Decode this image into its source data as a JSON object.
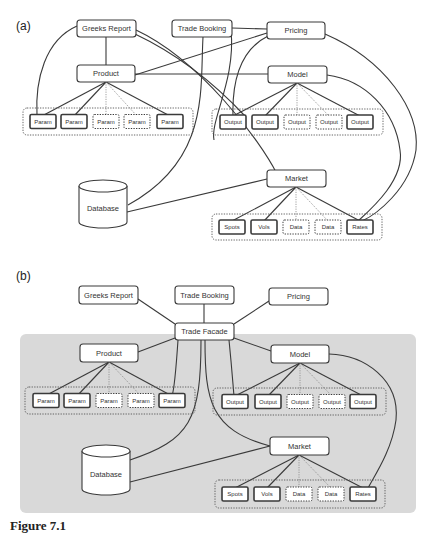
{
  "figure": {
    "caption_visible_fragment": "Figure 7.1",
    "colors": {
      "stroke": "#3a3a3a",
      "node_fill": "#ffffff",
      "facade_panel": "#d9d9d9",
      "background": "#ffffff"
    }
  },
  "panels": [
    {
      "id": "a",
      "label": "(a)",
      "label_pos": [
        16,
        30
      ],
      "background": null,
      "nodes": [
        {
          "id": "greeks",
          "label": "Greeks Report",
          "x": 77,
          "y": 20,
          "w": 59,
          "h": 17
        },
        {
          "id": "booking",
          "label": "Trade Booking",
          "x": 172,
          "y": 20,
          "w": 60,
          "h": 17
        },
        {
          "id": "pricing",
          "label": "Pricing",
          "x": 267,
          "y": 22,
          "w": 58,
          "h": 17
        },
        {
          "id": "product",
          "label": "Product",
          "x": 77,
          "y": 65,
          "w": 58,
          "h": 17
        },
        {
          "id": "model",
          "label": "Model",
          "x": 268,
          "y": 66,
          "w": 59,
          "h": 17
        },
        {
          "id": "market",
          "label": "Market",
          "x": 267,
          "y": 170,
          "w": 59,
          "h": 17
        }
      ],
      "database": {
        "label": "Database",
        "x": 79,
        "y": 180,
        "w": 48,
        "h": 48
      },
      "groups": [
        {
          "id": "params",
          "x": 23,
          "y": 108,
          "w": 170,
          "h": 27,
          "items": [
            {
              "label": "Param",
              "x": 30,
              "dashed": false
            },
            {
              "label": "Param",
              "x": 61,
              "dashed": false
            },
            {
              "label": "Param",
              "x": 93,
              "dashed": true
            },
            {
              "label": "Param",
              "x": 124,
              "dashed": true
            },
            {
              "label": "Param",
              "x": 157,
              "dashed": false
            }
          ]
        },
        {
          "id": "outputs",
          "x": 212,
          "y": 109,
          "w": 171,
          "h": 26,
          "items": [
            {
              "label": "Output",
              "x": 220,
              "dashed": false
            },
            {
              "label": "Output",
              "x": 252,
              "dashed": false
            },
            {
              "label": "Output",
              "x": 284,
              "dashed": true
            },
            {
              "label": "Output",
              "x": 316,
              "dashed": true
            },
            {
              "label": "Output",
              "x": 347,
              "dashed": false
            }
          ]
        },
        {
          "id": "data",
          "x": 212,
          "y": 214,
          "w": 170,
          "h": 26,
          "items": [
            {
              "label": "Spots",
              "x": 219,
              "dashed": false
            },
            {
              "label": "Vols",
              "x": 251,
              "dashed": false
            },
            {
              "label": "Data",
              "x": 283,
              "dashed": true
            },
            {
              "label": "Data",
              "x": 315,
              "dashed": true
            },
            {
              "label": "Rates",
              "x": 347,
              "dashed": false
            }
          ]
        }
      ],
      "edges": [
        "M106,37 L106,65",
        "M232,28 L267,29",
        "M267,33 L135,75",
        "M135,74 L268,74",
        "M77,26 C45,40 35,80 37,116",
        "M135,34 C190,60 230,100 245,116",
        "M136,30 C200,60 260,140 277,174",
        "M203,37 C200,90 210,160 128,205",
        "M268,36 C240,50 232,80 233,116",
        "M325,34 C385,60 420,110 416,150 C410,190 375,215 362,221",
        "M327,75 C365,80 395,110 400,150 C405,180 370,210 358,221",
        "M267,179 L127,212",
        "M231,30 C236,80 210,120 214,140"
      ],
      "fan_edges": [
        {
          "from": [
            106,
            82
          ],
          "solid_to": [
            [
              42,
              116
            ],
            [
              74,
              116
            ],
            [
              170,
              116
            ]
          ],
          "dotted_to": [
            [
              106,
              116
            ],
            [
              137,
              116
            ]
          ]
        },
        {
          "from": [
            297,
            83
          ],
          "solid_to": [
            [
              233,
              116
            ],
            [
              265,
              116
            ],
            [
              360,
              116
            ]
          ],
          "dotted_to": [
            [
              297,
              116
            ],
            [
              329,
              116
            ]
          ]
        },
        {
          "from": [
            296,
            187
          ],
          "solid_to": [
            [
              232,
              221
            ],
            [
              264,
              221
            ],
            [
              360,
              221
            ]
          ],
          "dotted_to": [
            [
              296,
              221
            ],
            [
              328,
              221
            ]
          ]
        }
      ]
    },
    {
      "id": "b",
      "label": "(b)",
      "label_pos": [
        16,
        280
      ],
      "background": {
        "x": 20,
        "y": 334,
        "w": 396,
        "h": 179
      },
      "nodes": [
        {
          "id": "greeks",
          "label": "Greeks Report",
          "x": 79,
          "y": 286,
          "w": 59,
          "h": 18
        },
        {
          "id": "booking",
          "label": "Trade Booking",
          "x": 175,
          "y": 286,
          "w": 59,
          "h": 18
        },
        {
          "id": "pricing",
          "label": "Pricing",
          "x": 269,
          "y": 288,
          "w": 59,
          "h": 17
        },
        {
          "id": "facade",
          "label": "Trade Facade",
          "x": 175,
          "y": 323,
          "w": 59,
          "h": 17
        },
        {
          "id": "product",
          "label": "Product",
          "x": 80,
          "y": 344,
          "w": 58,
          "h": 18
        },
        {
          "id": "model",
          "label": "Model",
          "x": 271,
          "y": 345,
          "w": 58,
          "h": 18
        },
        {
          "id": "market",
          "label": "Market",
          "x": 270,
          "y": 437,
          "w": 59,
          "h": 18
        }
      ],
      "database": {
        "label": "Database",
        "x": 82,
        "y": 445,
        "w": 48,
        "h": 50
      },
      "groups": [
        {
          "id": "params",
          "x": 25,
          "y": 387,
          "w": 170,
          "h": 27,
          "items": [
            {
              "label": "Param",
              "x": 33,
              "dashed": false
            },
            {
              "label": "Param",
              "x": 64,
              "dashed": false
            },
            {
              "label": "Param",
              "x": 96,
              "dashed": true
            },
            {
              "label": "Param",
              "x": 128,
              "dashed": true
            },
            {
              "label": "Param",
              "x": 159,
              "dashed": false
            }
          ]
        },
        {
          "id": "outputs",
          "x": 213,
          "y": 388,
          "w": 173,
          "h": 27,
          "items": [
            {
              "label": "Output",
              "x": 222,
              "dashed": false
            },
            {
              "label": "Output",
              "x": 255,
              "dashed": false
            },
            {
              "label": "Output",
              "x": 287,
              "dashed": true
            },
            {
              "label": "Output",
              "x": 319,
              "dashed": true
            },
            {
              "label": "Output",
              "x": 350,
              "dashed": false
            }
          ]
        },
        {
          "id": "data",
          "x": 215,
          "y": 480,
          "w": 170,
          "h": 28,
          "items": [
            {
              "label": "Spots",
              "x": 222,
              "dashed": false
            },
            {
              "label": "Vols",
              "x": 254,
              "dashed": false
            },
            {
              "label": "Data",
              "x": 286,
              "dashed": true
            },
            {
              "label": "Data",
              "x": 318,
              "dashed": true
            },
            {
              "label": "Rates",
              "x": 350,
              "dashed": false
            }
          ]
        }
      ],
      "edges": [
        "M138,299 L175,324",
        "M204,304 L204,323",
        "M269,301 L234,324",
        "M175,338 L138,352",
        "M234,338 L271,351",
        "M178,340 C176,370 174,390 172,396",
        "M201,340 C201,420 190,440 130,460",
        "M205,340 C205,400 210,430 270,446",
        "M229,340 C232,370 233,385 234,396",
        "M329,354 C365,355 400,380 396,420 C392,450 375,475 368,488",
        "M270,446 L130,482"
      ],
      "fan_edges": [
        {
          "from": [
            109,
            362
          ],
          "solid_to": [
            [
              45,
              396
            ],
            [
              77,
              396
            ],
            [
              172,
              396
            ]
          ],
          "dotted_to": [
            [
              109,
              396
            ],
            [
              141,
              396
            ]
          ]
        },
        {
          "from": [
            300,
            363
          ],
          "solid_to": [
            [
              235,
              396
            ],
            [
              268,
              396
            ],
            [
              363,
              396
            ]
          ],
          "dotted_to": [
            [
              300,
              396
            ],
            [
              332,
              396
            ]
          ]
        },
        {
          "from": [
            299,
            455
          ],
          "solid_to": [
            [
              235,
              488
            ],
            [
              267,
              488
            ],
            [
              363,
              488
            ]
          ],
          "dotted_to": [
            [
              299,
              488
            ],
            [
              331,
              488
            ]
          ]
        }
      ]
    }
  ]
}
